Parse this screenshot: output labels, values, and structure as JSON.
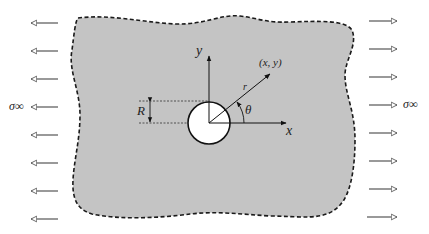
{
  "diagram": {
    "type": "infinite plate with circular hole under uniaxial tension",
    "labels": {
      "sigma_left": "σ∞",
      "sigma_right": "σ∞",
      "x_axis": "x",
      "y_axis": "y",
      "point": "(x, y)",
      "radius_vector": "r",
      "angle": "θ",
      "hole_radius": "R"
    },
    "colors": {
      "plate_fill": "#c4c4c4",
      "boundary": "#1a1a1a",
      "arrows": "#555555",
      "hole_fill": "#ffffff"
    },
    "load_arrows": {
      "count_per_side": 8,
      "left_direction": "left",
      "right_direction": "right"
    }
  }
}
